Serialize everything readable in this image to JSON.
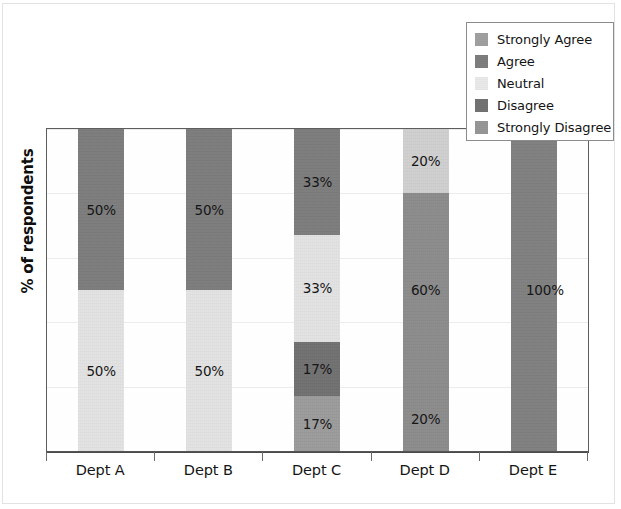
{
  "chart_data": {
    "type": "bar",
    "subtype": "stacked-100-percent",
    "title": "",
    "xlabel": "",
    "ylabel": "% of respondents",
    "ylim": [
      0,
      100
    ],
    "grid": true,
    "gridline_values": [
      0,
      20,
      40,
      60,
      80,
      100
    ],
    "legend_position": "top-right",
    "orientation": "vertical",
    "value_label_suffix": "%",
    "categories": [
      "Dept A",
      "Dept B",
      "Dept C",
      "Dept D",
      "Dept E"
    ],
    "series": [
      {
        "name": "Strongly Agree",
        "color": "#9e9e9e",
        "values": [
          0,
          0,
          0,
          0,
          0
        ]
      },
      {
        "name": "Agree",
        "color": "#7b7b7b",
        "values": [
          50,
          50,
          33,
          0,
          100
        ]
      },
      {
        "name": "Neutral",
        "color": "#e3e3e3",
        "values": [
          50,
          50,
          33,
          20,
          0
        ]
      },
      {
        "name": "Disagree",
        "color": "#6f6f6f",
        "values": [
          0,
          0,
          17,
          60,
          0
        ]
      },
      {
        "name": "Strongly Disagree",
        "color": "#8f8f8f",
        "values": [
          0,
          0,
          17,
          20,
          0
        ]
      }
    ],
    "stacks": [
      {
        "category": "Dept A",
        "segments": [
          {
            "series": "Agree",
            "value": 50,
            "label": "50%",
            "color": "#7b7b7b"
          },
          {
            "series": "Neutral",
            "value": 50,
            "label": "50%",
            "color": "#e3e3e3"
          }
        ]
      },
      {
        "category": "Dept B",
        "segments": [
          {
            "series": "Agree",
            "value": 50,
            "label": "50%",
            "color": "#7b7b7b"
          },
          {
            "series": "Neutral",
            "value": 50,
            "label": "50%",
            "color": "#e3e3e3"
          }
        ]
      },
      {
        "category": "Dept C",
        "segments": [
          {
            "series": "Agree",
            "value": 33,
            "label": "33%",
            "color": "#7b7b7b"
          },
          {
            "series": "Neutral",
            "value": 33,
            "label": "33%",
            "color": "#e3e3e3"
          },
          {
            "series": "Disagree",
            "value": 17,
            "label": "17%",
            "color": "#6f6f6f"
          },
          {
            "series": "Strongly Disagree",
            "value": 17,
            "label": "17%",
            "color": "#9a9a9a"
          }
        ]
      },
      {
        "category": "Dept D",
        "segments": [
          {
            "series": "Neutral",
            "value": 20,
            "label": "20%",
            "color": "#cfcfcf"
          },
          {
            "series": "Disagree",
            "value": 60,
            "label": "60%",
            "color": "#8a8a8a"
          },
          {
            "series": "Strongly Disagree",
            "value": 20,
            "label": "20%",
            "color": "#8a8a8a"
          }
        ]
      },
      {
        "category": "Dept E",
        "segments": [
          {
            "series": "Agree",
            "value": 100,
            "label": "100%",
            "color": "#7e7e7e"
          }
        ]
      }
    ]
  },
  "axes": {
    "y_title": "% of respondents",
    "x_tick_labels": [
      "Dept A",
      "Dept B",
      "Dept C",
      "Dept D",
      "Dept E"
    ]
  },
  "legend": {
    "items": [
      {
        "label": "Strongly Agree",
        "swatch_color": "#9e9e9e"
      },
      {
        "label": "Agree",
        "swatch_color": "#7b7b7b"
      },
      {
        "label": "Neutral",
        "swatch_color": "#e9e9e9"
      },
      {
        "label": "Disagree",
        "swatch_color": "#6f6f6f"
      },
      {
        "label": "Strongly Disagree",
        "swatch_color": "#949494"
      }
    ]
  },
  "style": {
    "plot_border_color": "#5d5d5d",
    "gridline_color": "#ececec",
    "axis_color": "#4a4a4a",
    "background": "#ffffff"
  }
}
